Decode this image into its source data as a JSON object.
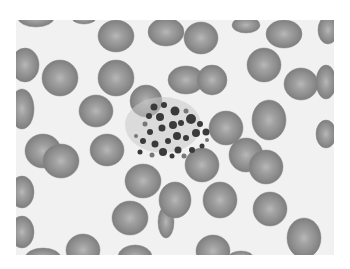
{
  "image": {
    "subject": "Blood smear micrograph (grayscale) showing red blood cells surrounding a central platelet clump",
    "colors": {
      "background": "#f1f1f1",
      "cell": "#8c8c8c",
      "cell_center": "#b4b4b4",
      "platelet": "#3a3a3a"
    }
  }
}
